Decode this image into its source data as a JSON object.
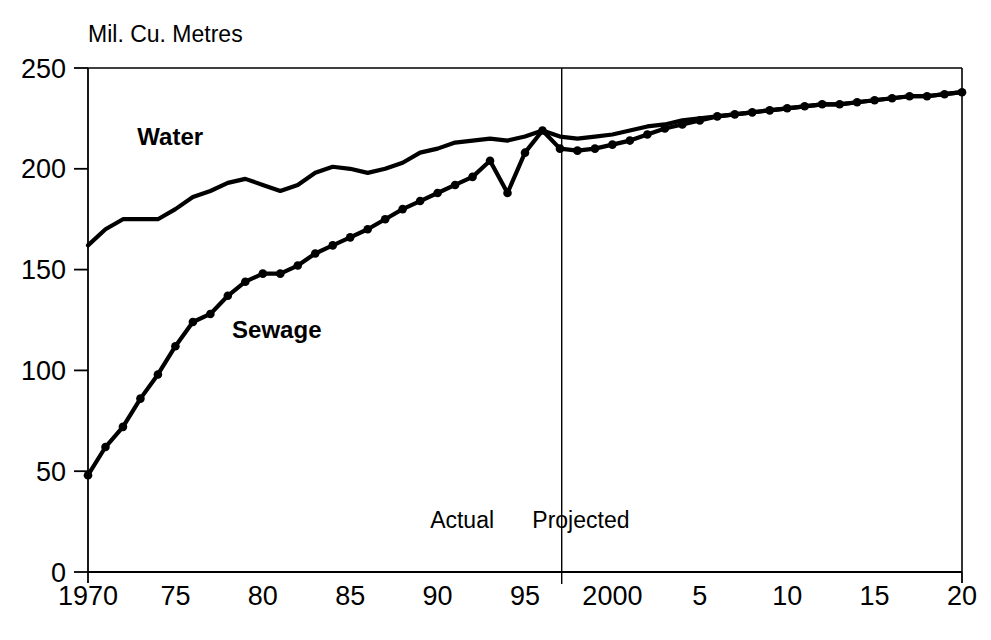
{
  "chart_data": {
    "type": "line",
    "title": "",
    "subtitle": "",
    "xlabel": "",
    "ylabel": "Mil. Cu. Metres",
    "unit_label": "Mil. Cu. Metres",
    "xlim": [
      1970,
      2020
    ],
    "ylim": [
      0,
      250
    ],
    "yticks": [
      0,
      50,
      100,
      150,
      200,
      250
    ],
    "ytick_labels": [
      "0",
      "50",
      "100",
      "150",
      "200",
      "250"
    ],
    "xticks": [
      1970,
      1975,
      1980,
      1985,
      1990,
      1995,
      2000,
      2005,
      2010,
      2015,
      2020
    ],
    "xtick_labels": [
      "1970",
      "75",
      "80",
      "85",
      "90",
      "95",
      "2000",
      "5",
      "10",
      "15",
      "20"
    ],
    "grid": false,
    "legend_position": "inline-annotations",
    "annotations": [
      {
        "text": "Water",
        "x": 1974.7,
        "y": 212,
        "style": "bold"
      },
      {
        "text": "Sewage",
        "x": 1980.8,
        "y": 116,
        "style": "bold"
      },
      {
        "text": "Actual",
        "x": 1991.4,
        "y": 22,
        "style": "regular"
      },
      {
        "text": "Projected",
        "x": 1998.2,
        "y": 22,
        "style": "regular"
      }
    ],
    "divider": {
      "x": 1997.1,
      "label_left": "Actual",
      "label_right": "Projected"
    },
    "x": [
      1970,
      1971,
      1972,
      1973,
      1974,
      1975,
      1976,
      1977,
      1978,
      1979,
      1980,
      1981,
      1982,
      1983,
      1984,
      1985,
      1986,
      1987,
      1988,
      1989,
      1990,
      1991,
      1992,
      1993,
      1994,
      1995,
      1996,
      1997,
      1998,
      1999,
      2000,
      2001,
      2002,
      2003,
      2004,
      2005,
      2006,
      2007,
      2008,
      2009,
      2010,
      2011,
      2012,
      2013,
      2014,
      2015,
      2016,
      2017,
      2018,
      2019,
      2020
    ],
    "series": [
      {
        "name": "Water",
        "markers": false,
        "values": [
          162,
          170,
          175,
          175,
          175,
          180,
          186,
          189,
          193,
          195,
          192,
          189,
          192,
          198,
          201,
          200,
          198,
          200,
          203,
          208,
          210,
          213,
          214,
          215,
          214,
          216,
          219,
          216,
          215,
          216,
          217,
          219,
          221,
          222,
          224,
          225,
          226,
          227,
          228,
          229,
          230,
          231,
          232,
          232,
          233,
          234,
          235,
          236,
          236,
          237,
          238
        ]
      },
      {
        "name": "Sewage",
        "markers": true,
        "values": [
          48,
          62,
          72,
          86,
          98,
          112,
          124,
          128,
          137,
          144,
          148,
          148,
          152,
          158,
          162,
          166,
          170,
          175,
          180,
          184,
          188,
          192,
          196,
          204,
          188,
          208,
          219,
          210,
          209,
          210,
          212,
          214,
          217,
          220,
          222,
          224,
          226,
          227,
          228,
          229,
          230,
          231,
          232,
          232,
          233,
          234,
          235,
          236,
          236,
          237,
          238
        ]
      }
    ]
  },
  "plot_geometry": {
    "left": 88,
    "right": 962,
    "top": 68,
    "bottom": 572
  },
  "colors": {
    "line": "#000000",
    "axis": "#000000",
    "background": "#ffffff"
  }
}
